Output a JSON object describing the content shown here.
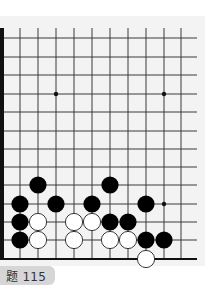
{
  "problem": {
    "label": "问题 115",
    "visible_label": "题 115"
  },
  "board": {
    "colors": {
      "line": "#3a3a3a",
      "border": "#111111",
      "black_stone": "#000000",
      "white_stone": "#ffffff",
      "white_stone_outline": "#222222",
      "background": "#f3f3f3",
      "badge_bg": "#d6d6d6",
      "badge_text": "#333333"
    },
    "geometry": {
      "cols_x": [
        20,
        38,
        56,
        74,
        92,
        110,
        128,
        146,
        164,
        181
      ],
      "rows_y": [
        38,
        57,
        75,
        94,
        112,
        131,
        149,
        167,
        185,
        204,
        222,
        240,
        259
      ],
      "line_right_end": 197,
      "top_y": 28,
      "left_border_x": 2,
      "stone_radius": 8.6
    },
    "star_points": [
      {
        "col": 2,
        "row": 3
      },
      {
        "col": 8,
        "row": 3
      },
      {
        "col": 8,
        "row": 9
      }
    ],
    "stones": [
      {
        "color": "black",
        "col": 1,
        "row": 8
      },
      {
        "color": "black",
        "col": 5,
        "row": 8
      },
      {
        "color": "black",
        "col": 0,
        "row": 9
      },
      {
        "color": "black",
        "col": 2,
        "row": 9
      },
      {
        "color": "black",
        "col": 4,
        "row": 9
      },
      {
        "color": "black",
        "col": 7,
        "row": 9
      },
      {
        "color": "black",
        "col": 0,
        "row": 10
      },
      {
        "color": "white",
        "col": 1,
        "row": 10
      },
      {
        "color": "white",
        "col": 3,
        "row": 10
      },
      {
        "color": "white",
        "col": 4,
        "row": 10
      },
      {
        "color": "black",
        "col": 5,
        "row": 10
      },
      {
        "color": "black",
        "col": 6,
        "row": 10
      },
      {
        "color": "black",
        "col": 0,
        "row": 11
      },
      {
        "color": "white",
        "col": 1,
        "row": 11
      },
      {
        "color": "white",
        "col": 3,
        "row": 11
      },
      {
        "color": "white",
        "col": 5,
        "row": 11
      },
      {
        "color": "white",
        "col": 6,
        "row": 11
      },
      {
        "color": "black",
        "col": 7,
        "row": 11
      },
      {
        "color": "black",
        "col": 8,
        "row": 11
      },
      {
        "color": "white",
        "col": 7,
        "row": 12
      }
    ]
  }
}
